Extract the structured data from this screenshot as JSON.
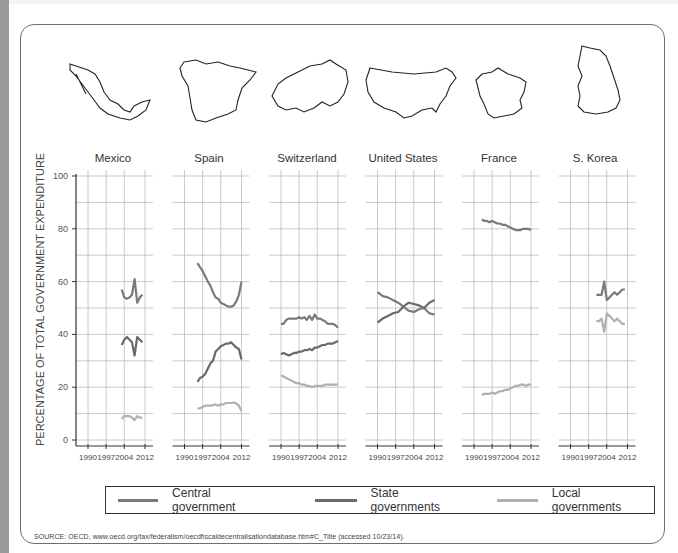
{
  "chart_data": {
    "type": "line",
    "title": "",
    "ylabel": "PERCENTAGE OF TOTAL GOVERNMENT EXPENDITURE",
    "xlabel": "",
    "ylim": [
      0,
      100
    ],
    "yticks": [
      0,
      20,
      40,
      60,
      80,
      100
    ],
    "xticks": [
      1990,
      1997,
      2004,
      2012
    ],
    "grid": true,
    "legend_position": "bottom",
    "legend": [
      "Central government",
      "State governments",
      "Local governments"
    ],
    "series_colors": {
      "Central government": "#7a7a7a",
      "State governments": "#6a6a6a",
      "Local governments": "#b0b0b0"
    },
    "panels": [
      {
        "country": "Mexico",
        "series": [
          {
            "name": "Central government",
            "x": [
              2003,
              2004,
              2005,
              2006,
              2007,
              2008,
              2009,
              2010,
              2011
            ],
            "values": [
              57,
              54,
              53.5,
              54,
              55,
              61,
              52,
              54,
              55
            ]
          },
          {
            "name": "State governments",
            "x": [
              2003,
              2004,
              2005,
              2006,
              2007,
              2008,
              2009,
              2010,
              2011
            ],
            "values": [
              36,
              38,
              39,
              38,
              37,
              32,
              39,
              38,
              37
            ]
          },
          {
            "name": "Local governments",
            "x": [
              2003,
              2004,
              2005,
              2006,
              2007,
              2008,
              2009,
              2010,
              2011
            ],
            "values": [
              8,
              9,
              9,
              9,
              8.5,
              7.5,
              9,
              8.5,
              8.5
            ]
          }
        ]
      },
      {
        "country": "Spain",
        "series": [
          {
            "name": "Central government",
            "x": [
              1995,
              1996,
              1997,
              1998,
              1999,
              2000,
              2001,
              2002,
              2003,
              2004,
              2005,
              2006,
              2007,
              2008,
              2009,
              2010,
              2011,
              2012
            ],
            "values": [
              67,
              65.5,
              64,
              62,
              60,
              58.5,
              56,
              54,
              53.5,
              52,
              51.5,
              51,
              50.5,
              50.5,
              51,
              52.5,
              55,
              60
            ]
          },
          {
            "name": "State governments",
            "x": [
              1995,
              1996,
              1997,
              1998,
              1999,
              2000,
              2001,
              2002,
              2003,
              2004,
              2005,
              2006,
              2007,
              2008,
              2009,
              2010,
              2011,
              2012
            ],
            "values": [
              22,
              23.5,
              24,
              25,
              27,
              29,
              30,
              33.5,
              34.5,
              35.5,
              36,
              36.5,
              36.5,
              37,
              36,
              35,
              34.5,
              30.5
            ]
          },
          {
            "name": "Local governments",
            "x": [
              1995,
              1996,
              1997,
              1998,
              1999,
              2000,
              2001,
              2002,
              2003,
              2004,
              2005,
              2006,
              2007,
              2008,
              2009,
              2010,
              2011,
              2012
            ],
            "values": [
              12,
              12,
              12.5,
              13,
              13,
              13,
              13.2,
              13.5,
              13,
              13.5,
              13.5,
              14,
              14,
              14,
              14.2,
              13.8,
              13,
              11
            ]
          }
        ]
      },
      {
        "country": "Switzerland",
        "series": [
          {
            "name": "Central government",
            "x": [
              1990,
              1991,
              1992,
              1993,
              1994,
              1995,
              1996,
              1997,
              1998,
              1999,
              2000,
              2001,
              2002,
              2003,
              2004,
              2005,
              2006,
              2007,
              2008,
              2009,
              2010,
              2011,
              2012
            ],
            "values": [
              44,
              44,
              45.5,
              46,
              46,
              46,
              46,
              46.5,
              46,
              46.5,
              45.5,
              47,
              45.5,
              47.5,
              46,
              46,
              45.5,
              45,
              44,
              44,
              44,
              43.5,
              42.5
            ]
          },
          {
            "name": "State governments",
            "x": [
              1990,
              1991,
              1992,
              1993,
              1994,
              1995,
              1996,
              1997,
              1998,
              1999,
              2000,
              2001,
              2002,
              2003,
              2004,
              2005,
              2006,
              2007,
              2008,
              2009,
              2010,
              2011,
              2012
            ],
            "values": [
              32.5,
              33,
              32.5,
              32,
              32.5,
              33,
              33,
              33.5,
              33.5,
              34,
              34,
              34.5,
              34,
              35,
              35,
              35.5,
              36,
              36,
              36.5,
              36.5,
              36.5,
              37,
              37.5
            ]
          },
          {
            "name": "Local governments",
            "x": [
              1990,
              1991,
              1992,
              1993,
              1994,
              1995,
              1996,
              1997,
              1998,
              1999,
              2000,
              2001,
              2002,
              2003,
              2004,
              2005,
              2006,
              2007,
              2008,
              2009,
              2010,
              2011,
              2012
            ],
            "values": [
              24.5,
              24,
              23.5,
              23,
              22.5,
              22,
              21.5,
              21.5,
              21,
              21,
              20.5,
              20.5,
              20,
              20.5,
              20.5,
              20.5,
              20.5,
              21,
              21,
              21,
              21,
              21,
              21
            ]
          }
        ]
      },
      {
        "country": "United States",
        "series": [
          {
            "name": "Central government",
            "x": [
              1990,
              1992,
              1994,
              1996,
              1998,
              2000,
              2002,
              2004,
              2006,
              2008,
              2010,
              2012
            ],
            "values": [
              56,
              54.5,
              54,
              53,
              52,
              50.5,
              49,
              48.5,
              49.5,
              50,
              48,
              47.5
            ]
          },
          {
            "name": "State governments",
            "x": [
              1990,
              1992,
              1994,
              1996,
              1998,
              2000,
              2002,
              2004,
              2006,
              2008,
              2010,
              2012
            ],
            "values": [
              44.5,
              46,
              47,
              48,
              48.5,
              50.5,
              52,
              51.5,
              51,
              50,
              52,
              53
            ]
          }
        ]
      },
      {
        "country": "France",
        "series": [
          {
            "name": "Central government",
            "x": [
              1993,
              1994,
              1995,
              1996,
              1997,
              1998,
              1999,
              2000,
              2001,
              2002,
              2003,
              2004,
              2005,
              2006,
              2007,
              2008,
              2009,
              2010,
              2011,
              2012
            ],
            "values": [
              83.5,
              83,
              83,
              82.5,
              83,
              82.5,
              82,
              82,
              81.5,
              81.5,
              81,
              80.5,
              80,
              79.5,
              79.5,
              79.5,
              80,
              80,
              80,
              79.5
            ]
          },
          {
            "name": "Local governments",
            "x": [
              1993,
              1994,
              1995,
              1996,
              1997,
              1998,
              1999,
              2000,
              2001,
              2002,
              2003,
              2004,
              2005,
              2006,
              2007,
              2008,
              2009,
              2010,
              2011,
              2012
            ],
            "values": [
              17,
              17.5,
              17.5,
              17.5,
              18,
              17.5,
              18,
              18.5,
              18.5,
              19,
              19,
              19.5,
              20,
              20.5,
              20.5,
              21,
              21,
              20.5,
              21,
              21
            ]
          }
        ]
      },
      {
        "country": "S. Korea",
        "series": [
          {
            "name": "Central government",
            "x": [
              2000,
              2001,
              2002,
              2003,
              2004,
              2005,
              2006,
              2007,
              2008,
              2009,
              2010,
              2011
            ],
            "values": [
              55,
              55,
              55,
              60,
              53,
              54,
              55,
              56,
              55,
              56,
              57,
              57
            ]
          },
          {
            "name": "Local governments",
            "x": [
              2000,
              2001,
              2002,
              2003,
              2004,
              2005,
              2006,
              2007,
              2008,
              2009,
              2010,
              2011
            ],
            "values": [
              45,
              45,
              46,
              41,
              48,
              47,
              46,
              45,
              46,
              45,
              44,
              44
            ]
          }
        ]
      }
    ]
  },
  "y_axis": {
    "label": "PERCENTAGE  OF TOTAL GOVERNMENT EXPENDITURE",
    "ticks": [
      "100",
      "80",
      "60",
      "40",
      "20",
      "0"
    ]
  },
  "countries": [
    "Mexico",
    "Spain",
    "Switzerland",
    "United States",
    "France",
    "S. Korea"
  ],
  "x_ticks": [
    "1990",
    "1997",
    "2004",
    "2012"
  ],
  "legend": {
    "items": [
      {
        "label": "Central government",
        "color": "#7a7a7a"
      },
      {
        "label": "State governments",
        "color": "#6a6a6a"
      },
      {
        "label": "Local governments",
        "color": "#b0b0b0"
      }
    ]
  },
  "source": "SOURCE: OECD, www.oecd.org/tax/federalism/oecdfiscaldecentralisationdatabase.htm#C_Title (accessed 10/23/14)."
}
